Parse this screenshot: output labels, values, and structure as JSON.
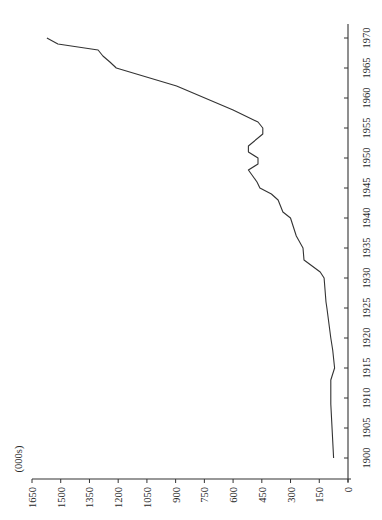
{
  "chart_data": {
    "type": "line",
    "orientation": "rotated-90-ccw",
    "title": "",
    "xlabel": "",
    "ylabel": "(000s)",
    "x": [
      1900,
      1909,
      1913,
      1915,
      1918,
      1920,
      1925,
      1926,
      1930,
      1931,
      1933,
      1935,
      1937,
      1940,
      1941,
      1943,
      1944,
      1945,
      1946,
      1948,
      1949,
      1950,
      1951,
      1952,
      1954,
      1955,
      1956,
      1958,
      1962,
      1965,
      1966,
      1967,
      1968,
      1969,
      1970
    ],
    "series": [
      {
        "name": "",
        "values": [
          75,
          90,
          90,
          70,
          80,
          90,
          110,
          115,
          125,
          145,
          230,
          235,
          270,
          300,
          340,
          365,
          400,
          460,
          475,
          520,
          470,
          470,
          520,
          520,
          445,
          445,
          470,
          600,
          895,
          1210,
          1243,
          1280,
          1305,
          1515,
          1572
        ]
      }
    ],
    "x_ticks": [
      "1900",
      "1905",
      "1910",
      "1915",
      "1920",
      "1925",
      "1930",
      "1935",
      "1940",
      "1945",
      "1950",
      "1955",
      "1960",
      "1965",
      "1970"
    ],
    "y_ticks": [
      "0",
      "150",
      "300",
      "450",
      "600",
      "750",
      "900",
      "1050",
      "1200",
      "1350",
      "1500",
      "1650"
    ],
    "xlim": [
      1898,
      1972
    ],
    "ylim": [
      0,
      1650
    ],
    "grid": false,
    "legend": "none",
    "line_color": "#333333"
  }
}
